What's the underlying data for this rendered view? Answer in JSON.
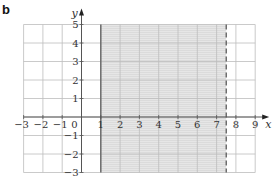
{
  "panel_label": "b",
  "chart_data": {
    "type": "region",
    "title": "",
    "xlabel": "x",
    "ylabel": "y",
    "xlim": [
      -3,
      9
    ],
    "ylim": [
      -3,
      5
    ],
    "grid": true,
    "x_ticks": [
      -3,
      -2,
      -1,
      1,
      2,
      3,
      4,
      5,
      6,
      7,
      8,
      9
    ],
    "y_ticks": [
      -3,
      -2,
      -1,
      1,
      2,
      3,
      4,
      5
    ],
    "origin_label": "0",
    "shaded_region": {
      "description": "1 <= x < 7.5",
      "x_min": 1,
      "x_max": 7.5,
      "lower_boundary": {
        "x": 1,
        "style": "solid",
        "inclusive": true
      },
      "upper_boundary": {
        "x": 7.5,
        "style": "dashed",
        "inclusive": false
      },
      "fill_color": "#e0e0e0"
    },
    "colors": {
      "grid": "#bdbdbd",
      "axis": "#555555",
      "boundary": "#666666"
    }
  }
}
